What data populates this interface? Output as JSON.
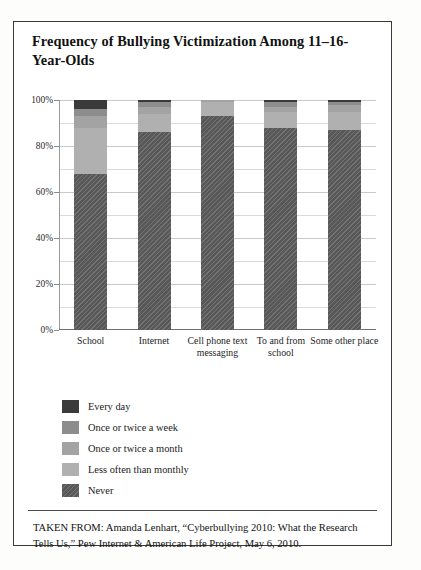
{
  "title": "Frequency of Bullying Victimization Among 11–16-Year-Olds",
  "citation": "TAKEN FROM: Amanda Lenhart, “Cyberbullying 2010: What the Research Tells Us,”  Pew Internet & American Life Project, May 6, 2010.",
  "legend": {
    "items": [
      {
        "label": "Every day",
        "color": "#3a3a3a"
      },
      {
        "label": "Once or twice a week",
        "color": "#8d8d8d"
      },
      {
        "label": "Once or twice a month",
        "color": "#a3a3a3"
      },
      {
        "label": "Less often than monthly",
        "color": "#b0b0b0"
      },
      {
        "label": "Never",
        "color": "#585858"
      }
    ]
  },
  "chart_data": {
    "type": "bar",
    "subtype": "stacked-100",
    "title": "Frequency of Bullying Victimization Among 11–16-Year-Olds",
    "xlabel": "",
    "ylabel": "",
    "ylim": [
      0,
      100
    ],
    "ytick_labels": [
      "0%",
      "20%",
      "40%",
      "60%",
      "80%",
      "100%"
    ],
    "ytick_values": [
      0,
      20,
      40,
      60,
      80,
      100
    ],
    "minor_gridlines": [
      10,
      30,
      50,
      70,
      90
    ],
    "grid": true,
    "legend_position": "below-left",
    "categories": [
      "School",
      "Internet",
      "Cell phone text messaging",
      "To and from school",
      "Some other place"
    ],
    "series": [
      {
        "name": "Never",
        "color": "#585858",
        "hatched": true,
        "values": [
          68,
          86,
          93,
          88,
          87
        ]
      },
      {
        "name": "Less often than monthly",
        "color": "#b0b0b0",
        "hatched": false,
        "values": [
          20,
          8,
          6,
          7,
          8
        ]
      },
      {
        "name": "Once or twice a month",
        "color": "#a3a3a3",
        "hatched": false,
        "values": [
          5,
          3,
          1,
          2,
          3
        ]
      },
      {
        "name": "Once or twice a week",
        "color": "#8d8d8d",
        "hatched": false,
        "values": [
          3,
          2,
          0,
          2,
          1
        ]
      },
      {
        "name": "Every day",
        "color": "#3a3a3a",
        "hatched": false,
        "values": [
          4,
          1,
          0,
          1,
          1
        ]
      }
    ]
  }
}
